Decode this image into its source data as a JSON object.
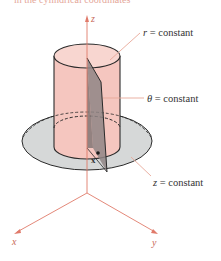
{
  "caption": "in the cylindrical coordinates",
  "labels": {
    "r_var": "r",
    "r_rest": " = constant",
    "theta_var": "θ",
    "theta_rest": " = constant",
    "z_var": "z",
    "z_rest": " = constant",
    "point": "x"
  },
  "axes": {
    "x": "x",
    "y": "y",
    "z": "z"
  },
  "colors": {
    "axis": "#e07a6a",
    "cylinder": "#f6c9c2",
    "disk": "#d3d6d6",
    "half_plane": "#8a8282",
    "leader": "#e8a899"
  }
}
